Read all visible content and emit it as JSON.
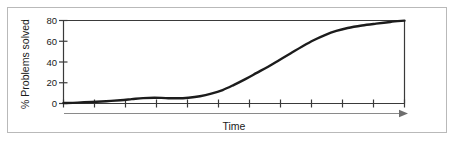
{
  "figure": {
    "background_color": "#ffffff",
    "frame_color": "#b9b9b9"
  },
  "chart_data": {
    "type": "line",
    "title": "",
    "subtitle": "",
    "xlabel": "Time",
    "ylabel": "% Problems solved",
    "xlim": [
      0,
      12
    ],
    "ylim": [
      0,
      80
    ],
    "x_tick_labels": [
      "",
      "",
      "",
      "",
      "",
      "",
      "",
      "",
      "",
      "",
      "",
      ""
    ],
    "x_tick_count": 12,
    "y_tick_labels": [
      "0",
      "20",
      "40",
      "60",
      "80"
    ],
    "y_ticks": [
      0,
      20,
      40,
      60,
      80
    ],
    "grid": false,
    "legend": false,
    "legend_position": "none",
    "line_color": "#1c1c1c",
    "line_width": 2.4,
    "axis_color": "#3a3a3a",
    "arrow_axis_color": "#8a8a8a",
    "annotation": "Sigmoid learning curve: slow start with early plateau, rapid acceleration, then asymptote at 80%",
    "series": [
      {
        "name": "% Problems solved",
        "x": [
          0.0,
          0.5,
          1.0,
          1.5,
          2.0,
          2.4,
          2.8,
          3.2,
          3.6,
          4.0,
          4.4,
          4.8,
          5.2,
          5.6,
          6.0,
          6.4,
          6.8,
          7.2,
          7.6,
          8.0,
          8.4,
          8.8,
          9.2,
          9.6,
          10.0,
          10.5,
          11.0,
          11.5,
          12.0
        ],
        "values": [
          0.5,
          0.8,
          1.4,
          2.2,
          3.2,
          4.2,
          5.2,
          5.6,
          5.2,
          5.0,
          5.6,
          7.0,
          9.5,
          13.0,
          18.0,
          23.5,
          29.5,
          35.5,
          42.0,
          48.5,
          55.0,
          61.0,
          66.0,
          70.0,
          72.8,
          75.2,
          77.0,
          78.6,
          79.9
        ]
      }
    ]
  },
  "axes": {
    "y_axis_label": "% Problems solved",
    "x_axis_label": "Time"
  }
}
